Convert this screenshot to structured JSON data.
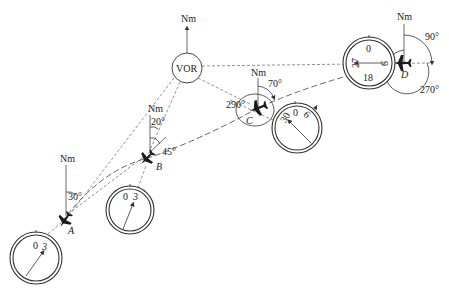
{
  "diagram": {
    "station": {
      "label": "VOR",
      "north_label": "Nm"
    },
    "aircraft": [
      {
        "id": "A",
        "label": "A",
        "north_label": "Nm",
        "angles": [
          "30°"
        ],
        "dial": {
          "marks": [
            "0",
            "3"
          ]
        }
      },
      {
        "id": "B",
        "label": "B",
        "north_label": "Nm",
        "angles": [
          "20°",
          "45°"
        ],
        "dial": {
          "marks": [
            "0",
            "3"
          ]
        }
      },
      {
        "id": "C",
        "label": "C",
        "north_label": "Nm",
        "angles": [
          "70°",
          "290°"
        ],
        "dial": {
          "marks": [
            "30",
            "0",
            "6"
          ]
        }
      },
      {
        "id": "D",
        "label": "D",
        "north_label": "Nm",
        "angles": [
          "90°",
          "270°"
        ],
        "dial": {
          "marks": [
            "0",
            "27",
            "18",
            "9"
          ]
        }
      }
    ]
  },
  "caption": {
    "text": ""
  }
}
